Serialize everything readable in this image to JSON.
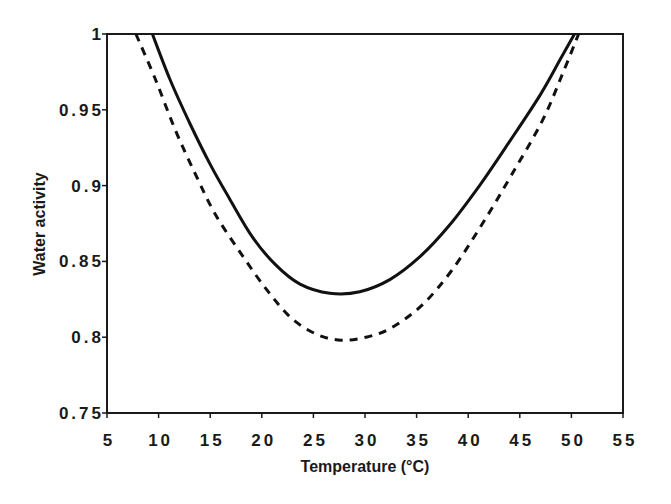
{
  "chart_data": {
    "type": "line",
    "title": "",
    "xlabel": "Temperature (°C)",
    "ylabel": "Water activity",
    "xlim": [
      5,
      55
    ],
    "ylim": [
      0.75,
      1
    ],
    "xticks": [
      5,
      10,
      15,
      20,
      25,
      30,
      35,
      40,
      45,
      50,
      55
    ],
    "yticks": [
      0.75,
      0.8,
      0.85,
      0.9,
      0.95,
      1
    ],
    "xtick_labels": [
      "5",
      "10",
      "15",
      "20",
      "25",
      "30",
      "35",
      "40",
      "45",
      "50",
      "55"
    ],
    "ytick_labels": [
      "0.75",
      "0.8",
      "0.85",
      "0.9",
      "0.95",
      "1"
    ],
    "grid": false,
    "legend": null,
    "series": [
      {
        "name": "solid",
        "style": "solid",
        "color": "#111111",
        "x": [
          9.4,
          11.1,
          13.1,
          15.0,
          16.9,
          19.1,
          21.3,
          23.7,
          26.6,
          29.5,
          32.4,
          35.3,
          38.2,
          41.2,
          44.1,
          47.0,
          48.9,
          50.3
        ],
        "y": [
          1.0,
          0.97,
          0.94,
          0.914,
          0.891,
          0.866,
          0.848,
          0.835,
          0.829,
          0.83,
          0.838,
          0.853,
          0.874,
          0.901,
          0.93,
          0.96,
          0.983,
          1.0
        ]
      },
      {
        "name": "dashed",
        "style": "dashed",
        "color": "#111111",
        "x": [
          7.8,
          9.7,
          11.6,
          13.6,
          15.5,
          18.0,
          20.4,
          22.8,
          25.3,
          27.7,
          30.1,
          32.5,
          35.5,
          38.4,
          41.3,
          44.2,
          47.2,
          49.1,
          50.7
        ],
        "y": [
          1.0,
          0.97,
          0.937,
          0.907,
          0.881,
          0.855,
          0.832,
          0.813,
          0.802,
          0.798,
          0.8,
          0.806,
          0.821,
          0.844,
          0.874,
          0.907,
          0.943,
          0.973,
          1.0
        ]
      }
    ]
  }
}
